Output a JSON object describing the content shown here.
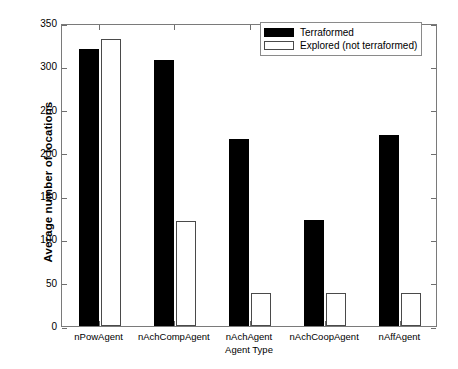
{
  "chart_data": {
    "type": "bar",
    "title": "",
    "xlabel": "Agent Type",
    "ylabel": "Average number of locations",
    "categories": [
      "nPowAgent",
      "nAchCompAgent",
      "nAchAgent",
      "nAchCoopAgent",
      "nAffAgent"
    ],
    "series": [
      {
        "name": "Terraformed",
        "color": "#000000",
        "style": "filled",
        "values": [
          320,
          307,
          216,
          122,
          221
        ]
      },
      {
        "name": "Explored (not terraformed)",
        "color": "#ffffff",
        "style": "hollow",
        "values": [
          332,
          121,
          38,
          38,
          38
        ]
      }
    ],
    "ylim": [
      0,
      350
    ],
    "yticks": [
      0,
      50,
      100,
      150,
      200,
      250,
      300,
      350
    ],
    "ytick_labels": [
      "0",
      "50",
      "100",
      "150",
      "200",
      "250",
      "300",
      "350"
    ],
    "grid": false,
    "legend_position": "top-right",
    "axis_color": "#7a7a7a",
    "background": "#ffffff"
  }
}
